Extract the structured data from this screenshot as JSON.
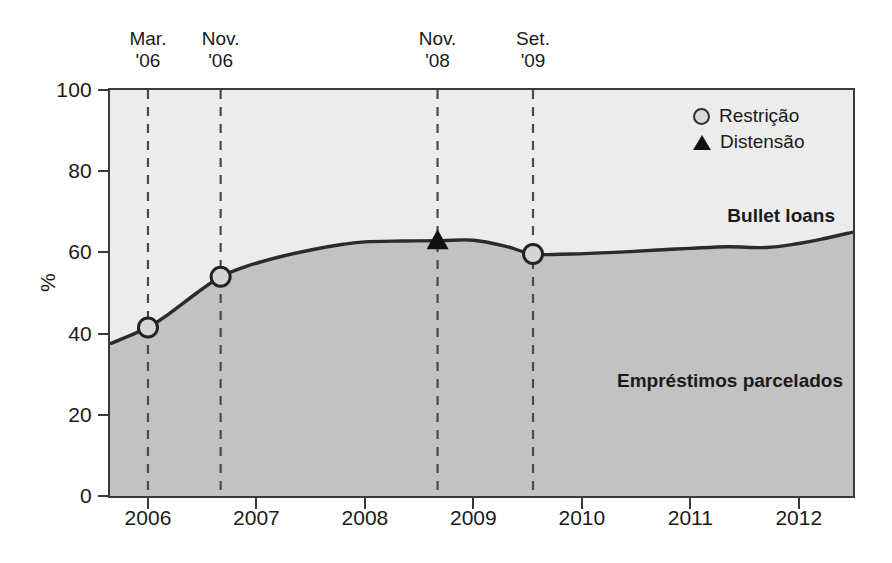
{
  "chart_data": {
    "type": "area",
    "title": "",
    "xlabel": "",
    "ylabel": "%",
    "xlim": [
      2005.65,
      2012.5
    ],
    "ylim": [
      0,
      100
    ],
    "grid": false,
    "stacked": true,
    "legend_position": "top-right",
    "xticks": [
      "2006",
      "2007",
      "2008",
      "2009",
      "2010",
      "2011",
      "2012"
    ],
    "xtick_values": [
      2006,
      2007,
      2008,
      2009,
      2010,
      2011,
      2012
    ],
    "yticks": [
      "0",
      "20",
      "40",
      "60",
      "80",
      "100"
    ],
    "ytick_values": [
      0,
      20,
      40,
      60,
      80,
      100
    ],
    "series": [
      {
        "name": "Empréstimos parcelados",
        "label_in_plot": "Empréstimos parcelados",
        "color": "#c2c2c2",
        "x": [
          2005.65,
          2006.0,
          2006.2,
          2006.45,
          2006.67,
          2006.9,
          2007.2,
          2007.5,
          2007.8,
          2008.0,
          2008.35,
          2008.7,
          2009.0,
          2009.3,
          2009.55,
          2009.9,
          2010.3,
          2010.7,
          2011.0,
          2011.35,
          2011.7,
          2012.0,
          2012.2,
          2012.5
        ],
        "values": [
          37.5,
          41.5,
          45.0,
          50.0,
          54.0,
          56.5,
          58.8,
          60.6,
          62.0,
          62.6,
          62.8,
          62.9,
          63.0,
          61.5,
          59.6,
          59.6,
          60.0,
          60.6,
          61.0,
          61.4,
          61.2,
          62.2,
          63.2,
          65.0
        ]
      },
      {
        "name": "Bullet loans",
        "label_in_plot": "Bullet loans",
        "color": "#ececec",
        "x": [
          2005.65,
          2006.0,
          2006.2,
          2006.45,
          2006.67,
          2006.9,
          2007.2,
          2007.5,
          2007.8,
          2008.0,
          2008.35,
          2008.7,
          2009.0,
          2009.3,
          2009.55,
          2009.9,
          2010.3,
          2010.7,
          2011.0,
          2011.35,
          2011.7,
          2012.0,
          2012.2,
          2012.5
        ],
        "values": [
          62.5,
          58.5,
          55.0,
          50.0,
          46.0,
          43.5,
          41.2,
          39.4,
          38.0,
          37.4,
          37.2,
          37.1,
          37.0,
          38.5,
          40.4,
          40.4,
          40.0,
          39.4,
          39.0,
          38.6,
          38.8,
          37.8,
          36.8,
          35.0
        ]
      }
    ],
    "events": [
      {
        "label_line1": "Mar.",
        "label_line2": "'06",
        "x": 2006.0,
        "marker": "Restrição",
        "marker_type": "circle",
        "value": 41.5
      },
      {
        "label_line1": "Nov.",
        "label_line2": "'06",
        "x": 2006.67,
        "marker": "Restrição",
        "marker_type": "circle",
        "value": 54.0
      },
      {
        "label_line1": "Nov.",
        "label_line2": "'08",
        "x": 2008.67,
        "marker": "Distensão",
        "marker_type": "triangle",
        "value": 63.0
      },
      {
        "label_line1": "Set.",
        "label_line2": "'09",
        "x": 2009.55,
        "marker": "Restrição",
        "marker_type": "circle",
        "value": 59.6
      }
    ],
    "legend": [
      {
        "marker": "circle",
        "label": "Restrição"
      },
      {
        "marker": "triangle",
        "label": "Distensão"
      }
    ],
    "colors": {
      "upper_band": "#ececec",
      "lower_band": "#c2c2c2",
      "line": "#2b2b2b",
      "axis": "#3a3a3a",
      "dashed_event_line": "#4a4a4a",
      "text": "#1a1a1a"
    }
  }
}
